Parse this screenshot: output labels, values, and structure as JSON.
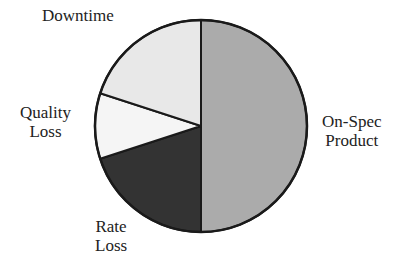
{
  "chart_data": {
    "type": "pie",
    "title": "",
    "start_angle_deg": 0,
    "direction": "clockwise",
    "slices": [
      {
        "label": "On-Spec Product",
        "value": 50,
        "color": "#ababab"
      },
      {
        "label": "Rate Loss",
        "value": 20,
        "color": "#333333"
      },
      {
        "label": "Quality Loss",
        "value": 10,
        "color": "#f5f5f5"
      },
      {
        "label": "Downtime",
        "value": 20,
        "color": "#e8e8e8"
      }
    ]
  },
  "labels": {
    "onspec": {
      "line1": "On-Spec",
      "line2": "Product"
    },
    "rate": {
      "line1": "Rate",
      "line2": "Loss"
    },
    "quality": {
      "line1": "Quality",
      "line2": "Loss"
    },
    "downtime": {
      "line1": "Downtime"
    }
  }
}
